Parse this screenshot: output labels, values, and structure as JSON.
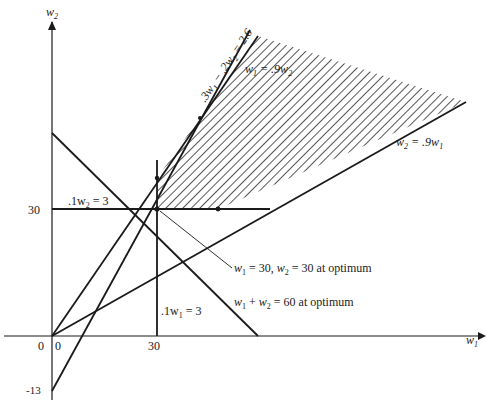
{
  "figure": {
    "axes": {
      "x_label": "w",
      "x_label_sub": "1",
      "y_label": "w",
      "y_label_sub": "2",
      "origin_label_left": "0",
      "origin_label_right": "0",
      "x_tick_30": "30",
      "y_tick_30": "30",
      "y_tick_neg13": "-13"
    },
    "constraints": [
      {
        "id": "w2_ge_30",
        "text": ".1w",
        "sub": "2",
        "rest": " = 3"
      },
      {
        "id": "w1_ge_30",
        "text": ".1w",
        "sub": "1",
        "rest": " = 3"
      },
      {
        "id": "w1_eq_09w2",
        "text_a": "w",
        "sub_a": "1",
        "mid": " = .9w",
        "sub_b": "2"
      },
      {
        "id": "w2_eq_09w1",
        "text_a": "w",
        "sub_a": "2",
        "mid": " = .9w",
        "sub_b": "1"
      },
      {
        "id": "ratio_line",
        "text": ".3w",
        "sub_a": "1",
        "mid": " − .2w",
        "sub_b": "2",
        "rest": " = 2.6"
      }
    ],
    "annotations": {
      "optimum_point": {
        "a": "w",
        "a_sub": "1",
        "b": " = 30, ",
        "c": "w",
        "c_sub": "2",
        "d": " = 30 at optimum"
      },
      "objective": {
        "a": "w",
        "a_sub": "1",
        "b": " + ",
        "c": "w",
        "c_sub": "2",
        "d": " = 60 at optimum"
      }
    },
    "colors": {
      "ink": "#1a1a1a",
      "background": "#ffffff",
      "hatch": "#2a2a2a"
    }
  }
}
